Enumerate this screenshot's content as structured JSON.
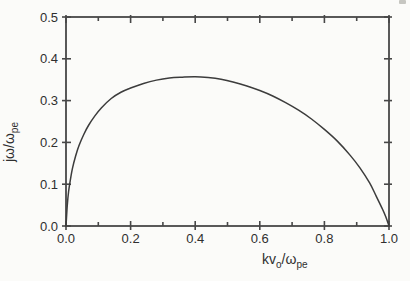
{
  "figure": {
    "background": "#fbfbf9",
    "line_color": "#3c3c3c",
    "axis_color": "#474747",
    "text_color": "#2f2f2f"
  },
  "chart_data": {
    "type": "line",
    "title": "",
    "xlabel": "kv_o/ω_pe",
    "ylabel": "jω/ω_pe",
    "xlabel_parts": [
      {
        "text": "kv",
        "sub": false
      },
      {
        "text": "o",
        "sub": true
      },
      {
        "text": "/ω",
        "sub": false
      },
      {
        "text": "pe",
        "sub": true
      }
    ],
    "ylabel_parts": [
      {
        "text": "jω/ω",
        "sub": false
      },
      {
        "text": "pe",
        "sub": true
      }
    ],
    "xlim": [
      0.0,
      1.0
    ],
    "ylim": [
      0.0,
      0.5
    ],
    "x_major_tick_step": 0.2,
    "x_minor_tick_step": 0.1,
    "y_major_tick_step": 0.1,
    "y_minor_tick_step": 0.1,
    "x_tick_labels": [
      "0.0",
      "0.2",
      "0.4",
      "0.6",
      "0.8",
      "1.0"
    ],
    "y_tick_labels": [
      "0.0",
      "0.1",
      "0.2",
      "0.3",
      "0.4",
      "0.5"
    ],
    "grid": false,
    "frame": true,
    "legend": null,
    "peak": {
      "x": 0.4,
      "y": 0.357
    },
    "series": [
      {
        "name": "growth-rate-curve",
        "color": "#3c3c3c",
        "points": [
          [
            0.0,
            0.0
          ],
          [
            0.004,
            0.05
          ],
          [
            0.008,
            0.082
          ],
          [
            0.013,
            0.108
          ],
          [
            0.02,
            0.138
          ],
          [
            0.03,
            0.168
          ],
          [
            0.04,
            0.192
          ],
          [
            0.055,
            0.219
          ],
          [
            0.07,
            0.241
          ],
          [
            0.09,
            0.264
          ],
          [
            0.11,
            0.283
          ],
          [
            0.14,
            0.305
          ],
          [
            0.17,
            0.32
          ],
          [
            0.2,
            0.33
          ],
          [
            0.24,
            0.341
          ],
          [
            0.28,
            0.349
          ],
          [
            0.32,
            0.354
          ],
          [
            0.36,
            0.356
          ],
          [
            0.4,
            0.357
          ],
          [
            0.44,
            0.355
          ],
          [
            0.48,
            0.351
          ],
          [
            0.52,
            0.344
          ],
          [
            0.56,
            0.335
          ],
          [
            0.6,
            0.324
          ],
          [
            0.64,
            0.311
          ],
          [
            0.68,
            0.295
          ],
          [
            0.72,
            0.277
          ],
          [
            0.76,
            0.256
          ],
          [
            0.8,
            0.231
          ],
          [
            0.84,
            0.203
          ],
          [
            0.88,
            0.169
          ],
          [
            0.91,
            0.139
          ],
          [
            0.94,
            0.103
          ],
          [
            0.96,
            0.072
          ],
          [
            0.98,
            0.04
          ],
          [
            0.99,
            0.022
          ],
          [
            1.0,
            0.0
          ]
        ]
      }
    ]
  }
}
